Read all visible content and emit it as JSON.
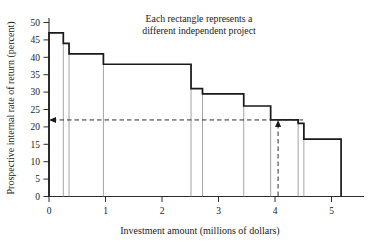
{
  "chart_data": {
    "type": "bar",
    "title": "",
    "annotation": "Each rectangle represents a\ndifferent independent project",
    "annotation_line1": "Each rectangle represents a",
    "annotation_line2": "different independent project",
    "xlabel": "Investment amount (millions of dollars)",
    "ylabel": "Prospective internal rate of return (percent)",
    "xlim": [
      0,
      5.5
    ],
    "ylim": [
      0,
      52
    ],
    "xticks": [
      0,
      1,
      2,
      3,
      4,
      5
    ],
    "xtick_labels": [
      "0",
      "1",
      "2",
      "3",
      "4",
      "5"
    ],
    "yticks": [
      0,
      5,
      10,
      15,
      20,
      25,
      30,
      35,
      40,
      45,
      50
    ],
    "ytick_labels": [
      "0",
      "5",
      "10",
      "15",
      "20",
      "25",
      "30",
      "35",
      "40",
      "45",
      "50"
    ],
    "grid": false,
    "legend": false,
    "edges": [
      0,
      0.25,
      0.35,
      0.95,
      2.48,
      2.68,
      3.4,
      3.87,
      4.35,
      4.45,
      5.1
    ],
    "values": [
      47,
      44,
      41,
      38,
      31,
      29.5,
      26,
      22,
      21,
      16.5
    ],
    "projects": [
      {
        "from": 0,
        "to": 0.25,
        "rate": 47
      },
      {
        "from": 0.25,
        "to": 0.35,
        "rate": 44
      },
      {
        "from": 0.35,
        "to": 0.95,
        "rate": 41
      },
      {
        "from": 0.95,
        "to": 2.48,
        "rate": 38
      },
      {
        "from": 2.48,
        "to": 2.68,
        "rate": 31
      },
      {
        "from": 2.68,
        "to": 3.4,
        "rate": 29.5
      },
      {
        "from": 3.4,
        "to": 3.87,
        "rate": 26
      },
      {
        "from": 3.87,
        "to": 4.35,
        "rate": 22
      },
      {
        "from": 4.35,
        "to": 4.45,
        "rate": 21
      },
      {
        "from": 4.45,
        "to": 5.1,
        "rate": 16.5
      }
    ],
    "reference_rate": 22,
    "reference_investment": 4.0,
    "colors": {
      "outline": "#1a1a1a",
      "divider": "#9a9a9a",
      "axis": "#2b2b2b",
      "dashed": "#2e2e2e",
      "background": "#ffffff"
    }
  }
}
